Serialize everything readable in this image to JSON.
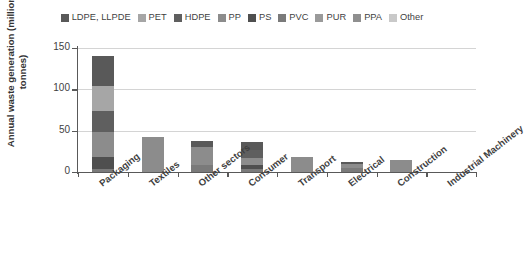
{
  "chart_data": {
    "type": "bar",
    "subtype": "stacked-bar",
    "title": "",
    "xlabel": "",
    "ylabel": "Annual waste generation (million tonnes)",
    "ylim": [
      0,
      150
    ],
    "yticks": [
      0,
      50,
      100,
      150
    ],
    "grid": true,
    "legend_position": "top",
    "categories": [
      "Packaging",
      "Textiles",
      "Other sectors",
      "Consumer",
      "Transport",
      "Electrical",
      "Construction",
      "Industrial Machinery"
    ],
    "series": [
      {
        "name": "LDPE, LLPDE",
        "color": "#595959",
        "values": [
          36,
          0,
          8,
          9,
          0,
          2,
          0,
          0
        ]
      },
      {
        "name": "PET",
        "color": "#a6a6a6",
        "values": [
          30,
          0,
          0,
          0,
          0,
          0,
          0,
          0
        ]
      },
      {
        "name": "HDPE",
        "color": "#5f5f5f",
        "values": [
          26,
          0,
          0,
          10,
          0,
          0,
          0,
          0
        ]
      },
      {
        "name": "PP",
        "color": "#8c8c8c",
        "values": [
          30,
          42,
          22,
          9,
          18,
          5,
          14,
          0
        ]
      },
      {
        "name": "PS",
        "color": "#4f4f4f",
        "values": [
          14,
          0,
          0,
          4,
          0,
          0,
          0,
          0
        ]
      },
      {
        "name": "PVC",
        "color": "#7a7a7a",
        "values": [
          4,
          0,
          8,
          4,
          0,
          5,
          0,
          0
        ]
      },
      {
        "name": "PUR",
        "color": "#9a9a9a",
        "values": [
          0,
          0,
          0,
          0,
          0,
          0,
          0,
          0
        ]
      },
      {
        "name": "PPA",
        "color": "#8f8f8f",
        "values": [
          0,
          0,
          0,
          0,
          0,
          0,
          0,
          0
        ]
      },
      {
        "name": "Other",
        "color": "#c9c9c9",
        "values": [
          0,
          0,
          0,
          0,
          0,
          0,
          0,
          0
        ]
      }
    ],
    "totals": [
      140,
      42,
      38,
      36,
      18,
      12,
      14,
      0
    ]
  },
  "legend": {
    "items": [
      {
        "label": "LDPE, LLPDE",
        "color": "#595959"
      },
      {
        "label": "PET",
        "color": "#a6a6a6"
      },
      {
        "label": "HDPE",
        "color": "#5f5f5f"
      },
      {
        "label": "PP",
        "color": "#8c8c8c"
      },
      {
        "label": "PS",
        "color": "#4f4f4f"
      },
      {
        "label": "PVC",
        "color": "#7a7a7a"
      },
      {
        "label": "PUR",
        "color": "#9a9a9a"
      },
      {
        "label": "PPA",
        "color": "#8f8f8f"
      },
      {
        "label": "Other",
        "color": "#c9c9c9"
      }
    ]
  },
  "axes": {
    "y_title": "Annual waste generation (million tonnes)",
    "y_ticks": [
      "150",
      "100",
      "50",
      "0"
    ],
    "x_categories": [
      "Packaging",
      "Textiles",
      "Other sectors",
      "Consumer",
      "Transport",
      "Electrical",
      "Construction",
      "Industrial Machinery"
    ]
  }
}
